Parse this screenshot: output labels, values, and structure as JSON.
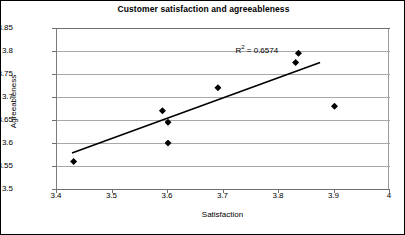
{
  "chart_data": {
    "type": "scatter",
    "title": "Customer satisfaction and agreeableness",
    "xlabel": "Satisfaction",
    "ylabel": "Agreeableness",
    "xlim": [
      3.4,
      4.0
    ],
    "ylim": [
      3.5,
      3.85
    ],
    "xticks": [
      "3.4",
      "3.5",
      "3.6",
      "3.7",
      "3.8",
      "3.9",
      "4"
    ],
    "xtick_values": [
      3.4,
      3.5,
      3.6,
      3.7,
      3.8,
      3.9,
      4.0
    ],
    "yticks": [
      "3.5",
      "3.55",
      "3.6",
      "3.65",
      "3.7",
      "3.75",
      "3.8",
      "3.85"
    ],
    "ytick_values": [
      3.5,
      3.55,
      3.6,
      3.65,
      3.7,
      3.75,
      3.8,
      3.85
    ],
    "grid": "horizontal",
    "legend": "none",
    "points": [
      {
        "x": 3.43,
        "y": 3.56
      },
      {
        "x": 3.59,
        "y": 3.67
      },
      {
        "x": 3.6,
        "y": 3.645
      },
      {
        "x": 3.6,
        "y": 3.6
      },
      {
        "x": 3.69,
        "y": 3.72
      },
      {
        "x": 3.83,
        "y": 3.775
      },
      {
        "x": 3.835,
        "y": 3.795
      },
      {
        "x": 3.9,
        "y": 3.68
      }
    ],
    "trendline": {
      "x0": 3.427,
      "y0": 3.578,
      "x1": 3.874,
      "y1": 3.775
    },
    "annotations": [
      {
        "name": "r2",
        "text_prefix": "R",
        "text_sup": "2",
        "text_suffix": " = 0.6574",
        "value": 0.6574,
        "x": 3.76,
        "y": 3.805
      }
    ]
  }
}
